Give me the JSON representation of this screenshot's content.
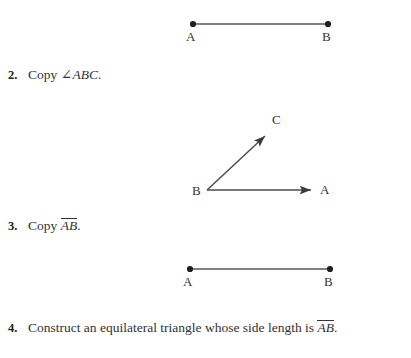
{
  "page": {
    "width": 411,
    "height": 358,
    "background": "#ffffff",
    "ink_color": "#333333",
    "line_color": "#555555"
  },
  "problems": [
    {
      "number": "2.",
      "prefix": "Copy ",
      "angle_symbol": "∠",
      "math": "ABC",
      "suffix": ".",
      "overline": false
    },
    {
      "number": "3.",
      "prefix": "Copy ",
      "angle_symbol": "",
      "math": "AB",
      "suffix": ".",
      "overline": true
    },
    {
      "number": "4.",
      "prefix": "Construct an equilateral triangle whose side length is ",
      "angle_symbol": "",
      "math": "AB",
      "suffix": ".",
      "overline": true
    }
  ],
  "figures": {
    "segment_top": {
      "name": "segment AB (top)",
      "endpoints": [
        {
          "label": "A",
          "x": 193,
          "y": 24
        },
        {
          "label": "B",
          "x": 328,
          "y": 24
        }
      ]
    },
    "angle": {
      "name": "angle ABC",
      "vertex": {
        "label": "B",
        "x": 207,
        "y": 190
      },
      "rays": [
        {
          "label": "A",
          "tip_x": 315,
          "tip_y": 190
        },
        {
          "label": "C",
          "tip_x": 269,
          "tip_y": 133
        }
      ]
    },
    "segment_bottom": {
      "name": "segment AB (bottom)",
      "endpoints": [
        {
          "label": "A",
          "x": 190,
          "y": 269
        },
        {
          "label": "B",
          "x": 330,
          "y": 269
        }
      ]
    }
  }
}
